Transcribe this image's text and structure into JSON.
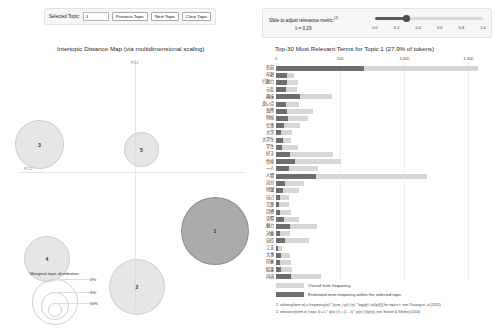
{
  "topic_control": {
    "label": "Selected Topic:",
    "value": "1",
    "previous_label": "Previous Topic",
    "next_label": "Next Topic",
    "clear_label": "Clear Topic"
  },
  "lambda_control": {
    "label": "Slide to adjust relevance metric:",
    "superscript": "(2)",
    "value_label": "λ = 0.29",
    "lambda": 0.29,
    "ticks": [
      "0.0",
      "0.2",
      "0.4",
      "0.6",
      "0.8",
      "1.0"
    ]
  },
  "left_panel": {
    "title": "Intertopic Distance Map (via multidimensional scaling)",
    "axis_x_label": "PC1",
    "axis_y_label": "PC2",
    "topics": [
      {
        "id": "1",
        "label": "1",
        "x": 181,
        "y": 141,
        "d": 68,
        "selected": true
      },
      {
        "id": "2",
        "label": "2",
        "x": 109,
        "y": 203,
        "d": 56,
        "selected": false
      },
      {
        "id": "3",
        "label": "3",
        "x": 15,
        "y": 64,
        "d": 49,
        "selected": false
      },
      {
        "id": "4",
        "label": "4",
        "x": 24,
        "y": 180,
        "d": 46,
        "selected": false
      },
      {
        "id": "5",
        "label": "5",
        "x": 124,
        "y": 76,
        "d": 35,
        "selected": false
      }
    ],
    "legend": {
      "title": "Marginal topic distribution",
      "ticks": [
        "2%",
        "5%",
        "10%"
      ]
    }
  },
  "right_panel": {
    "title": "Top-30 Most Relevant Terms for Topic 1 (27.9% of tokens)",
    "legend": {
      "overall": "Overall term frequency",
      "estimated": "Estimated term frequency within the selected topic"
    },
    "notes": [
      "1. saliency(term w) = frequency(w) * [sum_t p(t | w) * log(p(t | w)/p(t))] for topics t; see Chuang et. al (2012)",
      "2. relevance(term w | topic t) = λ * p(w | t) + (1 - λ) * p(w | t)/p(w); see Sievert & Shirley (2014)"
    ]
  },
  "chart_data": {
    "type": "bar",
    "title": "Top-30 Most Relevant Terms for Topic 1 (27.9% of tokens)",
    "xlabel": "",
    "ylabel": "",
    "xlim": [
      0,
      1700
    ],
    "grid": true,
    "legend_position": "bottom",
    "tick_values": [
      0,
      500,
      1000,
      1500
    ],
    "tick_labels": [
      "0",
      "500",
      "1,000",
      "1,500"
    ],
    "categories": [
      "名前",
      "年齢",
      "行動力",
      "元気",
      "趣味",
      "良い点",
      "長所",
      "特技",
      "仕事",
      "大学",
      "大学生",
      "学生",
      "好き",
      "性格",
      "一人",
      "人間",
      "自分",
      "特徴",
      "自己",
      "言葉",
      "目標",
      "実際",
      "魅力",
      "対象",
      "自信",
      "工夫",
      "大事",
      "印象",
      "結果",
      "内容"
    ],
    "series": [
      {
        "name": "Overall term frequency",
        "values": [
          1572,
          138,
          168,
          166,
          436,
          176,
          292,
          250,
          191,
          122,
          120,
          170,
          441,
          509,
          330,
          1174,
          219,
          179,
          103,
          101,
          120,
          178,
          322,
          112,
          254,
          46,
          112,
          116,
          124,
          353
        ]
      },
      {
        "name": "Estimated term frequency within the selected topic",
        "values": [
          690,
          84,
          87,
          79,
          188,
          80,
          88,
          92,
          60,
          37,
          52,
          47,
          112,
          146,
          104,
          310,
          70,
          52,
          28,
          24,
          28,
          60,
          108,
          34,
          72,
          14,
          37,
          34,
          38,
          114
        ]
      }
    ]
  }
}
